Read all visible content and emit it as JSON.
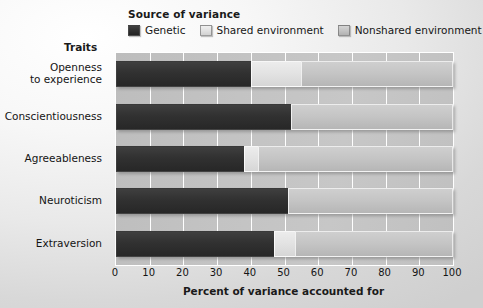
{
  "legend": {
    "title": "Source of variance",
    "items": [
      {
        "label": "Genetic",
        "key": "genetic",
        "color": "#313131"
      },
      {
        "label": "Shared environment",
        "key": "shared",
        "color": "#e2e2e2"
      },
      {
        "label": "Nonshared environment",
        "key": "nonshared",
        "color": "#c4c4c4"
      }
    ]
  },
  "axes": {
    "y_title": "Traits",
    "x_title": "Percent of variance accounted for",
    "x_ticks": [
      "0",
      "10",
      "20",
      "30",
      "40",
      "50",
      "60",
      "70",
      "80",
      "90",
      "100"
    ]
  },
  "chart_data": {
    "type": "bar",
    "orientation": "horizontal",
    "stacked": true,
    "title": "",
    "subtitle": "",
    "xlabel": "Percent of variance accounted for",
    "ylabel": "Traits",
    "xlim": [
      0,
      100
    ],
    "xticks": [
      0,
      10,
      20,
      30,
      40,
      50,
      60,
      70,
      80,
      90,
      100
    ],
    "grid": true,
    "legend_title": "Source of variance",
    "legend_position": "top",
    "categories": [
      "Openness to experience",
      "Conscientiousness",
      "Agreeableness",
      "Neuroticism",
      "Extraversion"
    ],
    "series": [
      {
        "name": "Genetic",
        "color": "#313131",
        "values": [
          40,
          52,
          38,
          51,
          47
        ]
      },
      {
        "name": "Shared environment",
        "color": "#e2e2e2",
        "values": [
          15,
          0,
          4,
          0,
          6
        ]
      },
      {
        "name": "Nonshared environment",
        "color": "#c4c4c4",
        "values": [
          45,
          48,
          58,
          49,
          47
        ]
      }
    ]
  }
}
